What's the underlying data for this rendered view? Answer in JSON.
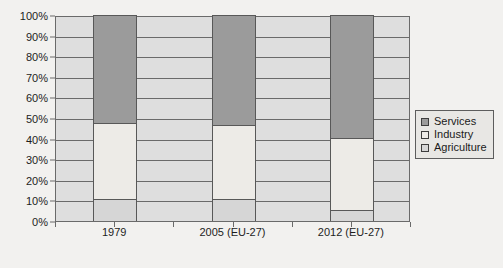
{
  "chart_data": {
    "type": "bar",
    "stacked": true,
    "stacked_percent": true,
    "title": "",
    "xlabel": "",
    "ylabel": "",
    "ylim": [
      0,
      100
    ],
    "grid": true,
    "legend_position": "right",
    "categories": [
      "1979",
      "2005 (EU-27)",
      "2012 (EU-27)"
    ],
    "ytick_labels": [
      "0%",
      "10%",
      "20%",
      "30%",
      "40%",
      "50%",
      "60%",
      "70%",
      "80%",
      "90%",
      "100%"
    ],
    "ytick_values": [
      0,
      10,
      20,
      30,
      40,
      50,
      60,
      70,
      80,
      90,
      100
    ],
    "series": [
      {
        "name": "Agriculture",
        "color": "#d6d6d6",
        "values": [
          10,
          10,
          5
        ]
      },
      {
        "name": "Industry",
        "color": "#edebe7",
        "values": [
          37,
          36,
          35
        ]
      },
      {
        "name": "Services",
        "color": "#9b9b9b",
        "values": [
          53,
          54,
          60
        ]
      }
    ]
  },
  "legend": {
    "items": [
      {
        "label": "Services",
        "color": "#9b9b9b"
      },
      {
        "label": "Industry",
        "color": "#edebe7"
      },
      {
        "label": "Agriculture",
        "color": "#d6d6d6"
      }
    ]
  }
}
